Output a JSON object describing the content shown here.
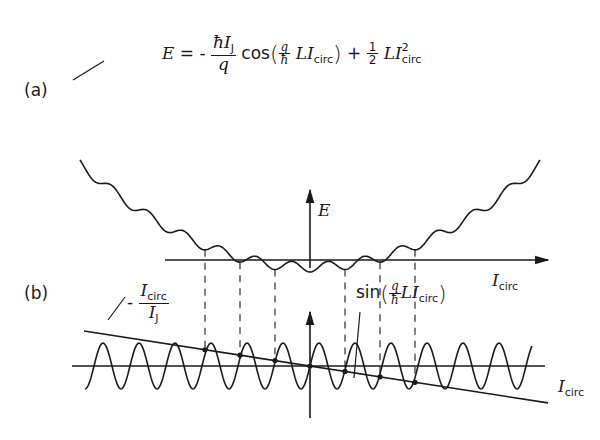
{
  "panels": {
    "a": {
      "label": "(a)",
      "equation": {
        "lhs": "E",
        "equals": "=",
        "minus": "-",
        "frac1_num_hbar": "ħ",
        "frac1_num_I": "I",
        "frac1_num_sub": "J",
        "frac1_den": "q",
        "cos": "cos",
        "inner_num": "q",
        "inner_den": "ħ",
        "inner_L": "L",
        "inner_I": "I",
        "inner_sub": "circ",
        "plus": "+",
        "half_num": "1",
        "half_den": "2",
        "L2": "L",
        "I2": "I",
        "sub2": "circ",
        "sup2": "2"
      },
      "y_axis_label": "E",
      "x_axis_label_I": "I",
      "x_axis_label_sub": "circ"
    },
    "b": {
      "label": "(b)",
      "line_label": {
        "minus": "-",
        "num_I": "I",
        "num_sub": "circ",
        "den_I": "I",
        "den_sub": "J"
      },
      "sine_label": {
        "sin": "sin",
        "q": "q",
        "hbar": "ħ",
        "L": "L",
        "I": "I",
        "sub": "circ"
      },
      "x_axis_label_I": "I",
      "x_axis_label_sub": "circ"
    }
  },
  "geometry": {
    "origin_x": 310,
    "upper_axis_y": 260,
    "lower_axis_y": 366,
    "sine_amplitude": 23,
    "sine_period": 36,
    "dashed_x": [
      205,
      240,
      275,
      345,
      380,
      415
    ]
  }
}
